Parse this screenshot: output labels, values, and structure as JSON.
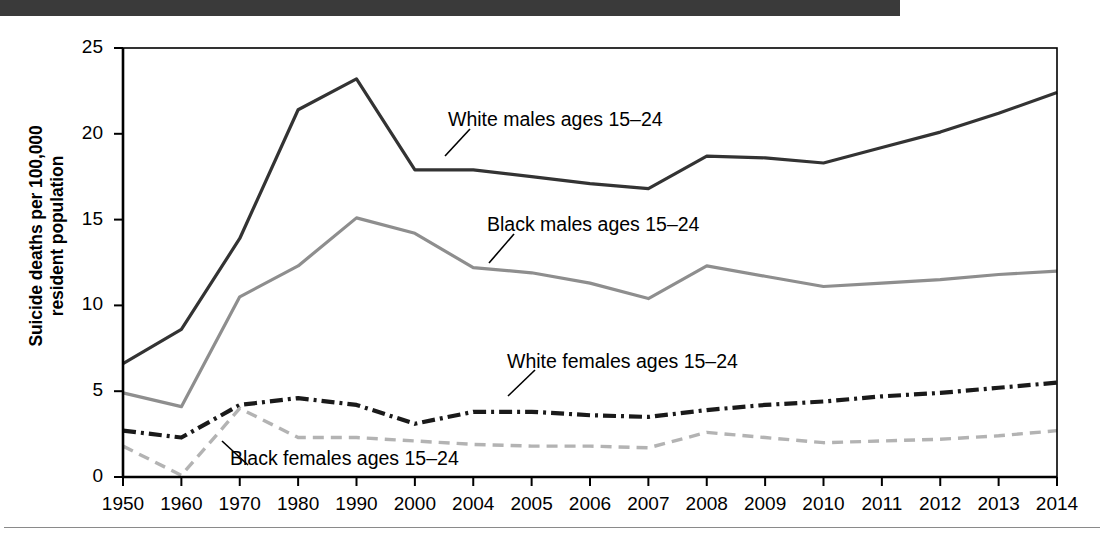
{
  "figure": {
    "y_axis_label_line1": "Suicide deaths per 100,000",
    "y_axis_label_line2": "resident population",
    "y_ticks": [
      "0",
      "5",
      "10",
      "15",
      "20",
      "25"
    ],
    "x_ticks": [
      "1950",
      "1960",
      "1970",
      "1980",
      "1990",
      "2000",
      "2004",
      "2005",
      "2006",
      "2007",
      "2008",
      "2009",
      "2010",
      "2011",
      "2012",
      "2013",
      "2014"
    ],
    "annotations": {
      "white_males": "White males ages 15–24",
      "black_males": "Black males ages 15–24",
      "white_females": "White females ages 15–24",
      "black_females": "Black females ages 15–24"
    },
    "colors": {
      "white_males": "#333333",
      "black_males": "#8e8e8e",
      "white_females": "#1a1a1a",
      "black_females": "#b3b3b3",
      "axis": "#000000",
      "topbar": "#3a3a3a",
      "rule": "#8a8a8a"
    }
  },
  "chart_data": {
    "type": "line",
    "title": "",
    "xlabel": "",
    "ylabel": "Suicide deaths per 100,000 resident population",
    "ylim": [
      0,
      25
    ],
    "yticks": [
      0,
      5,
      10,
      15,
      20,
      25
    ],
    "grid": false,
    "legend": "inline-annotations",
    "categories": [
      "1950",
      "1960",
      "1970",
      "1980",
      "1990",
      "2000",
      "2004",
      "2005",
      "2006",
      "2007",
      "2008",
      "2009",
      "2010",
      "2011",
      "2012",
      "2013",
      "2014"
    ],
    "series": [
      {
        "name": "White males ages 15–24",
        "style": "solid",
        "color": "#333333",
        "values": [
          6.6,
          8.6,
          13.9,
          21.4,
          23.2,
          17.9,
          17.9,
          17.5,
          17.1,
          16.8,
          18.7,
          18.6,
          18.3,
          19.2,
          20.1,
          21.2,
          22.4
        ]
      },
      {
        "name": "Black males ages 15–24",
        "style": "solid",
        "color": "#8e8e8e",
        "values": [
          4.9,
          4.1,
          10.5,
          12.3,
          15.1,
          14.2,
          12.2,
          11.9,
          11.3,
          10.4,
          12.3,
          11.7,
          11.1,
          11.3,
          11.5,
          11.8,
          12.0
        ]
      },
      {
        "name": "White females ages 15–24",
        "style": "dash-dot",
        "color": "#1a1a1a",
        "values": [
          2.7,
          2.3,
          4.2,
          4.6,
          4.2,
          3.1,
          3.8,
          3.8,
          3.6,
          3.5,
          3.9,
          4.2,
          4.4,
          4.7,
          4.9,
          5.2,
          5.5
        ]
      },
      {
        "name": "Black females ages 15–24",
        "style": "dashed",
        "color": "#b3b3b3",
        "values": [
          1.8,
          0.1,
          4.0,
          2.3,
          2.3,
          2.1,
          1.9,
          1.8,
          1.8,
          1.7,
          2.6,
          2.3,
          2.0,
          2.1,
          2.2,
          2.4,
          2.7
        ]
      }
    ]
  }
}
